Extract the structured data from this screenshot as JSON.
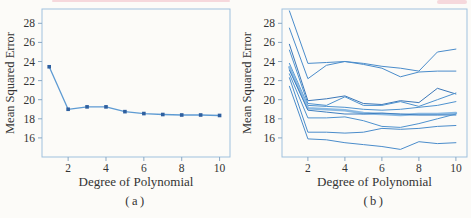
{
  "page": {
    "background": "#fcfbf8",
    "artifact_color": "#f0bcc4",
    "text_color": "#333333"
  },
  "chart_data": [
    {
      "type": "line",
      "panel": "a",
      "caption": "(a)",
      "xlabel": "Degree of Polynomial",
      "ylabel": "Mean Squared Error",
      "x": [
        1,
        2,
        3,
        4,
        5,
        6,
        7,
        8,
        9,
        10
      ],
      "xticks": [
        2,
        4,
        6,
        8,
        10
      ],
      "yticks": [
        16,
        18,
        20,
        22,
        24,
        26,
        28
      ],
      "xlim": [
        0.62,
        10.55
      ],
      "ylim": [
        14.0,
        29.5
      ],
      "grid": false,
      "legend": "none",
      "frame_color": "#9fc1de",
      "tick_color": "#8aa8c4",
      "line_width": 1.3,
      "series": [
        {
          "name": "validation-set-mse",
          "color": "#5e9bd3",
          "marker": "square",
          "marker_color": "#2e5f9f",
          "values": [
            23.45,
            19.0,
            19.25,
            19.25,
            18.75,
            18.55,
            18.45,
            18.4,
            18.4,
            18.35
          ]
        }
      ]
    },
    {
      "type": "line",
      "panel": "b",
      "caption": "(b)",
      "xlabel": "Degree of Polynomial",
      "ylabel": "Mean Squared Error",
      "x": [
        1,
        2,
        3,
        4,
        5,
        6,
        7,
        8,
        9,
        10
      ],
      "xticks": [
        2,
        4,
        6,
        8,
        10
      ],
      "yticks": [
        16,
        18,
        20,
        22,
        24,
        26,
        28
      ],
      "xlim": [
        0.6,
        10.6
      ],
      "ylim": [
        14.0,
        29.5
      ],
      "grid": false,
      "legend": "none",
      "frame_color": "#9fc1de",
      "tick_color": "#8aa8c4",
      "line_width": 1.0,
      "series": [
        {
          "name": "split-1",
          "color": "#4a8ccb",
          "values": [
            29.3,
            23.8,
            23.9,
            24.0,
            23.8,
            23.5,
            23.3,
            23.0,
            25.0,
            25.3
          ]
        },
        {
          "name": "split-2",
          "color": "#4a8ccb",
          "values": [
            27.5,
            22.2,
            23.6,
            24.0,
            23.7,
            23.3,
            22.4,
            22.9,
            23.0,
            23.0
          ]
        },
        {
          "name": "split-3",
          "color": "#3b77b8",
          "values": [
            25.8,
            19.9,
            20.1,
            20.4,
            19.6,
            19.5,
            19.9,
            19.7,
            21.2,
            20.6
          ]
        },
        {
          "name": "split-4",
          "color": "#4e92cf",
          "values": [
            25.2,
            19.6,
            19.4,
            20.3,
            19.4,
            19.4,
            19.8,
            19.3,
            20.0,
            20.7
          ]
        },
        {
          "name": "split-5",
          "color": "#4e92cf",
          "values": [
            23.8,
            19.4,
            19.3,
            19.2,
            19.0,
            18.9,
            19.0,
            19.2,
            19.4,
            19.8
          ]
        },
        {
          "name": "split-6",
          "color": "#8ab9e2",
          "width": 2.6,
          "values": [
            23.4,
            19.1,
            19.0,
            18.9,
            18.6,
            18.5,
            18.4,
            18.5,
            18.5,
            18.6
          ]
        },
        {
          "name": "split-7",
          "color": "#3f7fc0",
          "values": [
            23.1,
            18.9,
            18.7,
            18.5,
            18.5,
            18.6,
            18.5,
            18.4,
            18.4,
            18.4
          ]
        },
        {
          "name": "split-8",
          "color": "#4e92cf",
          "values": [
            22.7,
            18.1,
            18.1,
            18.2,
            17.8,
            17.2,
            17.1,
            17.5,
            18.0,
            18.5
          ]
        },
        {
          "name": "split-9",
          "color": "#4a8ccb",
          "values": [
            22.3,
            16.6,
            16.6,
            16.5,
            16.6,
            17.0,
            16.9,
            17.0,
            17.2,
            17.3
          ]
        },
        {
          "name": "split-10",
          "color": "#4a8ccb",
          "values": [
            21.4,
            15.9,
            15.8,
            15.5,
            15.3,
            15.1,
            14.8,
            15.6,
            15.4,
            15.5
          ]
        }
      ]
    }
  ]
}
